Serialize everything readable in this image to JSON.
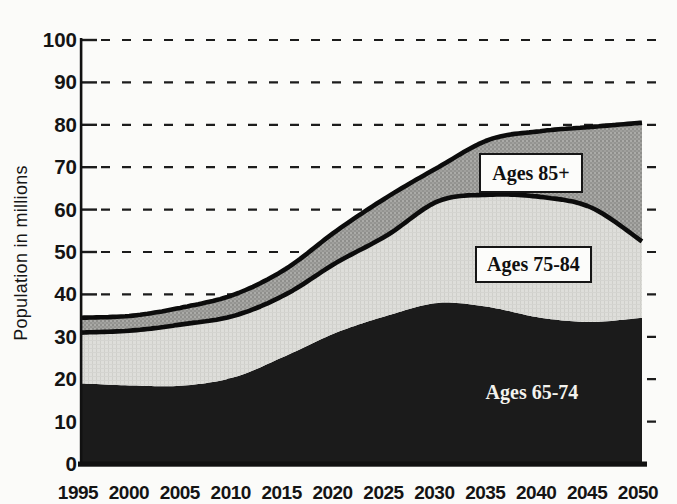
{
  "figure": {
    "ylabel": "Population in millions",
    "note": "stacked area chart of US population age 65 and older, 1995-2050"
  },
  "chart_data": {
    "type": "area",
    "stacked": true,
    "x": [
      1995,
      2000,
      2005,
      2010,
      2015,
      2020,
      2025,
      2030,
      2035,
      2040,
      2045,
      2050
    ],
    "series": [
      {
        "name": "Ages 65-74",
        "values": [
          19,
          18.5,
          18.5,
          20.5,
          25.5,
          31,
          35,
          38,
          37,
          34.5,
          33.5,
          34.5
        ]
      },
      {
        "name": "Ages 75-84",
        "values": [
          12,
          13,
          14.5,
          14.5,
          14.5,
          16.5,
          19,
          24,
          26.5,
          28.5,
          27,
          18
        ]
      },
      {
        "name": "Ages 85+",
        "values": [
          3.5,
          3.5,
          4,
          5,
          6,
          7.5,
          9,
          8,
          13,
          15.5,
          19,
          28
        ]
      }
    ],
    "cumulative_tops": {
      "ages_65_74": [
        19,
        18.5,
        18.5,
        20.5,
        25.5,
        31,
        35,
        38,
        37,
        34.5,
        33.5,
        34.5
      ],
      "ages_75_84": [
        31,
        31.5,
        33,
        35,
        40,
        47.5,
        54,
        62,
        63.5,
        63,
        60.5,
        52.5
      ],
      "ages_85_plus": [
        34.5,
        35,
        37,
        40,
        46,
        55,
        63,
        70,
        76.5,
        78.5,
        79.5,
        80.5
      ]
    },
    "title": "",
    "xlabel": "",
    "ylabel": "Population in millions",
    "ylim": [
      0,
      100
    ],
    "yticks": [
      0,
      10,
      20,
      30,
      40,
      50,
      60,
      70,
      80,
      90,
      100
    ],
    "xticks": [
      "1995",
      "2000",
      "2005",
      "2010",
      "2015",
      "2020",
      "2025",
      "2030",
      "2035",
      "2040",
      "2045",
      "2050"
    ],
    "grid": "dashed horizontal",
    "legend": "inline labels on areas",
    "colors": {
      "ages_65_74": "#1b1b1b",
      "ages_75_84": "#dcdcd8",
      "ages_85_plus": "#9d9d9a",
      "boundary_line": "#0c0c0c",
      "grid_line": "#1c1c1c"
    }
  }
}
